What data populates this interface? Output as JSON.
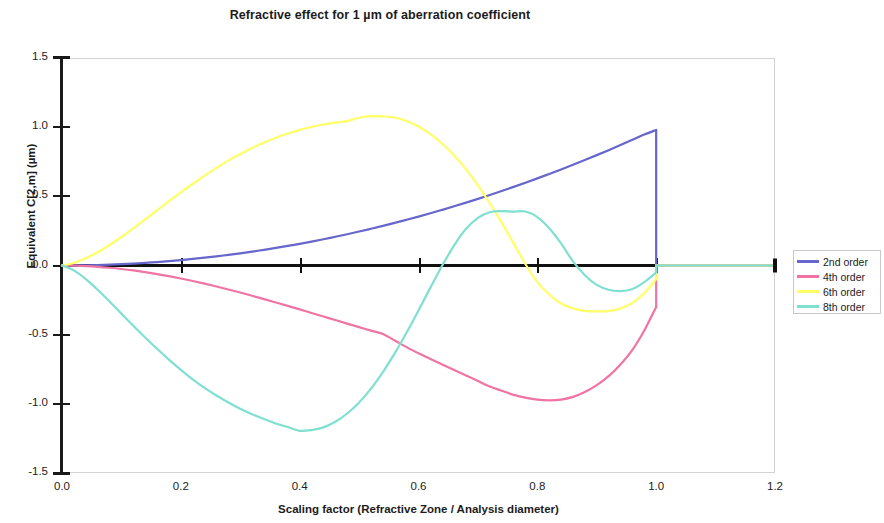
{
  "chart_data": {
    "type": "line",
    "title": "Refractive effect for 1 µm of aberration coefficient",
    "xlabel": "Scaling factor (Refractive Zone / Analysis diameter)",
    "ylabel": "Equivalent C[2,m] (µm)",
    "xlim": [
      0.0,
      1.2
    ],
    "ylim": [
      -1.5,
      1.5
    ],
    "xticks": [
      "0.0",
      "0.2",
      "0.4",
      "0.6",
      "0.8",
      "1.0",
      "1.2"
    ],
    "xtick_values": [
      0.0,
      0.2,
      0.4,
      0.6,
      0.8,
      1.0,
      1.2
    ],
    "yticks": [
      "1.5",
      "1.0",
      "0.5",
      "0.0",
      "-0.5",
      "-1.0",
      "-1.5"
    ],
    "ytick_values": [
      1.5,
      1.0,
      0.5,
      0.0,
      -0.5,
      -1.0,
      -1.5
    ],
    "grid": false,
    "legend_position": "right",
    "zero_reference_line": true,
    "colors": {
      "2nd order": "#6666cc",
      "4th order": "#ef74a4",
      "6th order": "#ffff66",
      "8th order": "#7fe0d2",
      "zero_line": "#111111",
      "axis": "#1a1a1a",
      "plot_border": "#d3d3d3"
    },
    "x": [
      0.0,
      0.02,
      0.04,
      0.06,
      0.08,
      0.1,
      0.12,
      0.14,
      0.16,
      0.18,
      0.2,
      0.22,
      0.24,
      0.26,
      0.28,
      0.3,
      0.32,
      0.34,
      0.36,
      0.38,
      0.4,
      0.42,
      0.44,
      0.46,
      0.48,
      0.5,
      0.52,
      0.54,
      0.56,
      0.58,
      0.6,
      0.62,
      0.64,
      0.66,
      0.68,
      0.7,
      0.72,
      0.74,
      0.76,
      0.78,
      0.8,
      0.82,
      0.84,
      0.86,
      0.88,
      0.9,
      0.92,
      0.94,
      0.96,
      0.98,
      1.0,
      1.0001,
      1.02,
      1.1,
      1.2
    ],
    "series": [
      {
        "name": "2nd order",
        "color": "#6666cc",
        "values": [
          0.0,
          0.0004,
          0.0016,
          0.0035,
          0.0063,
          0.0098,
          0.0141,
          0.0192,
          0.0251,
          0.0318,
          0.0392,
          0.0474,
          0.0564,
          0.0662,
          0.0768,
          0.0882,
          0.1004,
          0.1133,
          0.1271,
          0.1416,
          0.1569,
          0.1731,
          0.19,
          0.2076,
          0.2261,
          0.2454,
          0.2655,
          0.2863,
          0.308,
          0.3304,
          0.3537,
          0.3777,
          0.4025,
          0.4282,
          0.4546,
          0.4818,
          0.5098,
          0.5386,
          0.5682,
          0.5986,
          0.6298,
          0.6618,
          0.6946,
          0.7282,
          0.7627,
          0.7979,
          0.8339,
          0.8707,
          0.9083,
          0.9468,
          0.98,
          0.0,
          0.0,
          0.0,
          0.0
        ]
      },
      {
        "name": "4th order",
        "color": "#ef74a4",
        "values": [
          0.0,
          -0.0011,
          -0.0042,
          -0.0093,
          -0.0163,
          -0.0251,
          -0.0357,
          -0.048,
          -0.0618,
          -0.0772,
          -0.094,
          -0.1121,
          -0.1314,
          -0.1518,
          -0.1733,
          -0.1956,
          -0.2188,
          -0.2427,
          -0.2671,
          -0.2921,
          -0.3174,
          -0.343,
          -0.3687,
          -0.3945,
          -0.4202,
          -0.4457,
          -0.4709,
          -0.4956,
          -0.542,
          -0.59,
          -0.635,
          -0.675,
          -0.715,
          -0.755,
          -0.795,
          -0.835,
          -0.875,
          -0.905,
          -0.935,
          -0.955,
          -0.97,
          -0.975,
          -0.97,
          -0.95,
          -0.915,
          -0.865,
          -0.8,
          -0.715,
          -0.61,
          -0.47,
          -0.3,
          0.0,
          0.0,
          0.0,
          0.0
        ]
      },
      {
        "name": "6th order",
        "color": "#ffff66",
        "values": [
          0.0,
          0.018,
          0.052,
          0.096,
          0.148,
          0.206,
          0.268,
          0.333,
          0.399,
          0.465,
          0.529,
          0.591,
          0.65,
          0.706,
          0.758,
          0.806,
          0.85,
          0.889,
          0.924,
          0.954,
          0.98,
          1.001,
          1.019,
          1.033,
          1.044,
          1.068,
          1.08,
          1.078,
          1.07,
          1.045,
          1.005,
          0.95,
          0.88,
          0.795,
          0.695,
          0.58,
          0.45,
          0.31,
          0.16,
          0.01,
          -0.12,
          -0.21,
          -0.275,
          -0.31,
          -0.328,
          -0.332,
          -0.33,
          -0.31,
          -0.27,
          -0.2,
          -0.1,
          0.0,
          0.0,
          0.0,
          0.0
        ]
      },
      {
        "name": "8th order",
        "color": "#7fe0d2",
        "values": [
          0.0,
          -0.035,
          -0.098,
          -0.175,
          -0.26,
          -0.348,
          -0.435,
          -0.52,
          -0.602,
          -0.68,
          -0.754,
          -0.823,
          -0.885,
          -0.94,
          -0.99,
          -1.035,
          -1.075,
          -1.11,
          -1.142,
          -1.168,
          -1.195,
          -1.19,
          -1.17,
          -1.13,
          -1.07,
          -0.99,
          -0.89,
          -0.77,
          -0.635,
          -0.485,
          -0.325,
          -0.16,
          0.0,
          0.145,
          0.265,
          0.345,
          0.385,
          0.393,
          0.39,
          0.39,
          0.35,
          0.27,
          0.16,
          0.03,
          -0.07,
          -0.14,
          -0.175,
          -0.185,
          -0.17,
          -0.12,
          -0.05,
          0.0,
          0.0,
          0.0,
          0.0
        ]
      }
    ],
    "annotations": [
      {
        "text": "All curves drop to zero at scaling factor 1.0 and remain at zero to 1.2"
      }
    ]
  },
  "legend": {
    "items": [
      {
        "label": "2nd order",
        "color": "#6666cc"
      },
      {
        "label": "4th order",
        "color": "#ef74a4"
      },
      {
        "label": "6th order",
        "color": "#ffff66"
      },
      {
        "label": "8th order",
        "color": "#7fe0d2"
      }
    ]
  }
}
